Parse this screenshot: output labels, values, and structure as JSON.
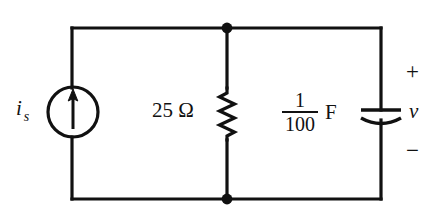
{
  "figure": {
    "type": "electrical-circuit-schematic",
    "background_color": "#ffffff",
    "line_color": "#111111",
    "width": 439,
    "height": 222
  },
  "elements": {
    "current_source": {
      "symbol": "circle-with-up-arrow",
      "label_symbol": "i",
      "label_subscript": "s",
      "arrow_direction": "up"
    },
    "resistor": {
      "symbol": "zigzag",
      "value": "25",
      "unit": "Ω",
      "label": "25 Ω"
    },
    "capacitor": {
      "symbol": "curved-plate-capacitor",
      "numerator": "1",
      "denominator": "100",
      "unit": "F"
    },
    "voltage": {
      "plus": "+",
      "name": "v",
      "minus": "−"
    }
  },
  "nodes": {
    "top_junction": "●",
    "bottom_junction": "●"
  }
}
